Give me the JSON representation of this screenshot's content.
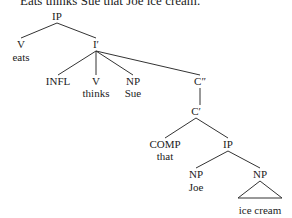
{
  "caption": "Eats thinks Sue that Joe ice cream.",
  "line_color": "#333333",
  "nodes": [
    {
      "id": "ip_root",
      "label": "IP",
      "x": 57,
      "y": 10
    },
    {
      "id": "v_eats",
      "label": "V",
      "x": 21,
      "y": 38
    },
    {
      "id": "w_eats",
      "label": "eats",
      "x": 21,
      "y": 51
    },
    {
      "id": "ibar",
      "label": "I′",
      "x": 96,
      "y": 38
    },
    {
      "id": "infl",
      "label": "INFL",
      "x": 58,
      "y": 75
    },
    {
      "id": "v_thinks",
      "label": "V",
      "x": 96,
      "y": 75
    },
    {
      "id": "w_thinks",
      "label": "thinks",
      "x": 96,
      "y": 87
    },
    {
      "id": "np_sue",
      "label": "NP",
      "x": 133,
      "y": 75
    },
    {
      "id": "w_sue",
      "label": "Sue",
      "x": 133,
      "y": 87
    },
    {
      "id": "cdbl",
      "label": "C″",
      "x": 200,
      "y": 75
    },
    {
      "id": "cbar",
      "label": "C′",
      "x": 196,
      "y": 105
    },
    {
      "id": "comp",
      "label": "COMP",
      "x": 165,
      "y": 138
    },
    {
      "id": "w_that",
      "label": "that",
      "x": 165,
      "y": 150
    },
    {
      "id": "ip_emb",
      "label": "IP",
      "x": 228,
      "y": 138
    },
    {
      "id": "np_joe",
      "label": "NP",
      "x": 196,
      "y": 168
    },
    {
      "id": "w_joe",
      "label": "Joe",
      "x": 196,
      "y": 181
    },
    {
      "id": "np_ic",
      "label": "NP",
      "x": 260,
      "y": 168
    },
    {
      "id": "w_icecream",
      "label": "ice cream",
      "x": 260,
      "y": 204
    }
  ],
  "edges": [
    [
      57,
      23,
      21,
      38
    ],
    [
      57,
      23,
      96,
      38
    ],
    [
      96,
      51,
      58,
      75
    ],
    [
      96,
      51,
      96,
      75
    ],
    [
      96,
      51,
      133,
      75
    ],
    [
      96,
      51,
      200,
      75
    ],
    [
      200,
      88,
      200,
      105
    ],
    [
      196,
      118,
      165,
      138
    ],
    [
      196,
      118,
      228,
      138
    ],
    [
      228,
      151,
      196,
      168
    ],
    [
      228,
      151,
      260,
      168
    ]
  ],
  "triangle": [
    [
      260,
      181
    ],
    [
      238,
      198
    ],
    [
      282,
      198
    ]
  ]
}
